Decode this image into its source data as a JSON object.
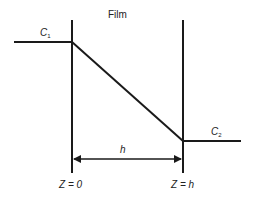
{
  "diagram": {
    "title": "Film",
    "left_concentration": {
      "symbol": "C",
      "subscript": "1"
    },
    "right_concentration": {
      "symbol": "C",
      "subscript": "2"
    },
    "thickness_label": "h",
    "left_boundary_label": "Z = 0",
    "right_boundary_label": "Z = h",
    "line_color": "#1a1a1a",
    "geometry": {
      "left_wall_x": 72,
      "right_wall_x": 183,
      "wall_top_y": 20,
      "wall_bottom_y": 173,
      "c1_level_y": 42,
      "c2_level_y": 141,
      "arrow_y": 159
    }
  }
}
